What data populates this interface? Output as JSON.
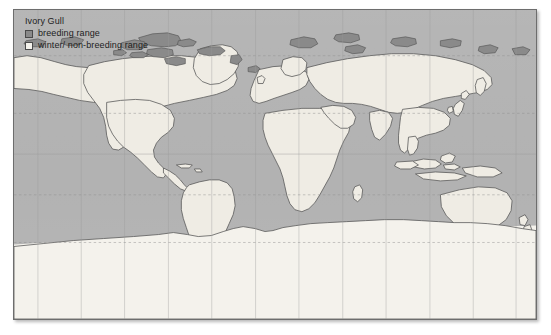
{
  "map": {
    "title": "Ivory Gull",
    "projection": "equirectangular world map",
    "legend": {
      "items": [
        {
          "label": "breeding range",
          "swatch_color": "#8a8a8a",
          "name": "breeding-range"
        },
        {
          "label": "winter/ non-breeding range",
          "swatch_color": "#f2f0ea",
          "name": "winter-non-breeding-range"
        }
      ]
    },
    "colors": {
      "ocean": "#b2b2b2",
      "land": "#efece4",
      "breeding": "#8a8a8a",
      "winter": "#f4f2ec",
      "coastline": "#5a5a5a",
      "graticule": "#9a9a9a",
      "border": "#6d6d6d",
      "page_background": "#ffffff"
    },
    "graticule": {
      "meridian_longitudes": [
        -150,
        -120,
        -90,
        -60,
        -30,
        0,
        30,
        60,
        90,
        120,
        150
      ],
      "parallel_latitudes": [
        66.5,
        23.5,
        0,
        -23.5,
        -66.5
      ],
      "dashed_parallels": [
        66.5,
        23.5,
        -23.5,
        -66.5
      ],
      "solid_parallels": [
        0
      ]
    }
  }
}
